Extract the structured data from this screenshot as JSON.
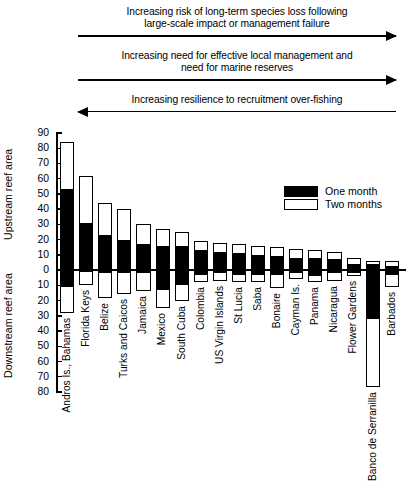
{
  "annotations": [
    {
      "text": "Increasing risk of long-term species loss following large-scale impact or management failure",
      "line1": "Increasing risk of long-term species loss following",
      "line2": "large-scale impact or management failure",
      "direction": "right"
    },
    {
      "text": "Increasing need for effective local management and need for marine reserves",
      "line1": "Increasing need for effective local management and",
      "line2": "need for marine reserves",
      "direction": "right"
    },
    {
      "text": "Increasing resilience to recruitment over-fishing",
      "line1": "Increasing resilience to recruitment over-fishing",
      "line2": "",
      "direction": "left"
    }
  ],
  "axes": {
    "upstream_title": "Upstream reef area",
    "downstream_title": "Downstream reef area"
  },
  "legend": {
    "items": [
      {
        "label": "One month",
        "fill": "black"
      },
      {
        "label": "Two months",
        "fill": "white"
      }
    ]
  },
  "chart_data": {
    "type": "bar",
    "title": "",
    "subtitle": "",
    "xlabel": "",
    "ylabel": "Upstream reef area / Downstream reef area",
    "ylim": [
      -80,
      90
    ],
    "grid": false,
    "legend_position": "top-right",
    "note": "Diverging bar chart. Positive values = upstream reef area, negative values = downstream reef area. Black bars (One month) are drawn in front of / within white bars (Two months).",
    "ytick_labels_upstream": [
      "90",
      "80",
      "70",
      "60",
      "50",
      "40",
      "30",
      "20",
      "10",
      "0"
    ],
    "ytick_labels_downstream": [
      "10",
      "20",
      "30",
      "40",
      "50",
      "60",
      "70",
      "80"
    ],
    "categories": [
      "Andros Is., Bahamas",
      "Florida Keys",
      "Belize",
      "Turks and Caicos",
      "Jamaica",
      "Mexico",
      "South Cuba",
      "Colombia",
      "US Virgin Islands",
      "St Lucia",
      "Saba",
      "Bonaire",
      "Cayman Is.",
      "Panama",
      "Nicaragua",
      "Flower Gardens",
      "Banco de Serranilla",
      "Barbados"
    ],
    "series": [
      {
        "name": "One month",
        "fill": "black",
        "upstream": [
          53,
          31,
          23,
          20,
          17,
          16,
          16,
          13,
          12,
          11,
          10,
          9,
          8,
          8,
          7,
          4,
          4,
          3
        ],
        "downstream": [
          -11,
          -1,
          -2,
          -2,
          -2,
          -13,
          -10,
          -3,
          -2,
          -3,
          -3,
          -3,
          -2,
          -4,
          -2,
          -2,
          -32,
          -3
        ]
      },
      {
        "name": "Two months",
        "fill": "white",
        "upstream": [
          84,
          62,
          44,
          40,
          30,
          27,
          25,
          19,
          18,
          17,
          16,
          15,
          14,
          13,
          12,
          8,
          6,
          6
        ],
        "downstream": [
          -28,
          -10,
          -18,
          -16,
          -14,
          -25,
          -20,
          -8,
          -7,
          -8,
          -8,
          -12,
          -6,
          -8,
          -7,
          -4,
          -77,
          -11
        ]
      }
    ]
  }
}
